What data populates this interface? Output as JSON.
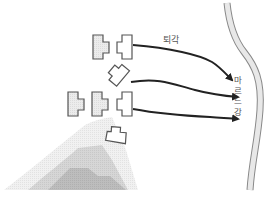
{
  "labels": {
    "retreat": "퇴각",
    "river": "마르느 강",
    "river_chars": [
      "마",
      "르",
      "느",
      "강"
    ]
  },
  "colors": {
    "unit_stroke": "#555555",
    "unit_fill_shaded": "#e6e6e6",
    "unit_fill_plain": "#ffffff",
    "arrow": "#222222",
    "river_stroke": "#888888",
    "river_fill": "#e8e8e8",
    "hill_level_1": "#eeeeee",
    "hill_level_2": "#d4d4d4",
    "hill_level_3": "#bfbfbf",
    "text": "#555555"
  },
  "units": [
    {
      "id": "unit-top-left",
      "style": "shaded"
    },
    {
      "id": "unit-top-right",
      "style": "plain"
    },
    {
      "id": "unit-rotated",
      "style": "plain"
    },
    {
      "id": "unit-mid-1",
      "style": "shaded"
    },
    {
      "id": "unit-mid-2",
      "style": "shaded"
    },
    {
      "id": "unit-mid-3",
      "style": "plain"
    },
    {
      "id": "unit-bottom",
      "style": "plain"
    }
  ],
  "arrows": [
    {
      "id": "arrow-top",
      "from": "unit-top-right",
      "to": "river"
    },
    {
      "id": "arrow-middle",
      "from": "unit-rotated",
      "to": "river"
    },
    {
      "id": "arrow-bottom",
      "from": "unit-mid-3",
      "to": "river"
    }
  ],
  "terrain": {
    "hill_levels": 3
  }
}
